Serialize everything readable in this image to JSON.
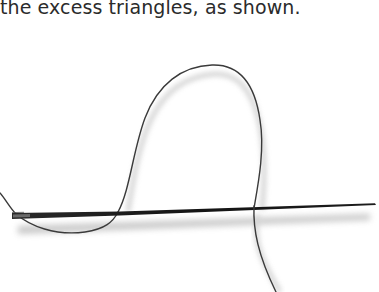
{
  "document": {
    "caption": "the excess triangles, as shown."
  },
  "illustration": {
    "subject": "needle-and-thread",
    "colors": {
      "needle": "#1a1a1a",
      "thread": "#3a3a3a",
      "shadow": "#bdbdbd",
      "background": "#ffffff",
      "text": "#2b2b2b"
    }
  }
}
